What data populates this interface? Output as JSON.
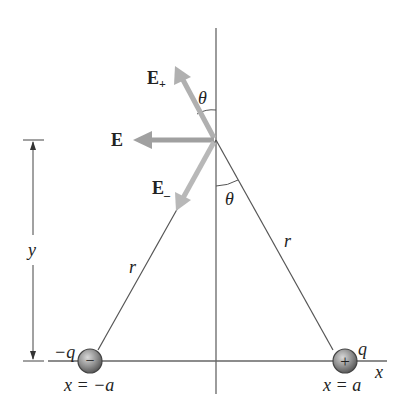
{
  "diagram": {
    "vector_labels": {
      "E_plus": "E",
      "E_plus_sub": "+",
      "E": "E",
      "E_minus": "E",
      "E_minus_sub": "–"
    },
    "angle_labels": {
      "upper": "θ",
      "lower": "θ"
    },
    "distance_labels": {
      "left_r": "r",
      "right_r": "r",
      "height": "y"
    },
    "axis_label": "x",
    "charges": {
      "negative": {
        "label": "−q",
        "symbol": "−",
        "position": "x = −a"
      },
      "positive": {
        "label": "q",
        "symbol": "+",
        "position": "x = a"
      }
    },
    "colors": {
      "line": "#555555",
      "arrow": "#a8a8a8",
      "charge": "#8a8a8a"
    }
  }
}
